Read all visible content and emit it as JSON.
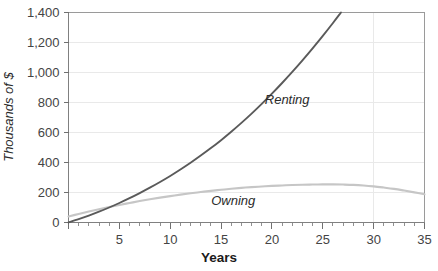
{
  "chart_data": {
    "type": "line",
    "title": "",
    "subtitle": "",
    "xlabel": "Years",
    "ylabel": "Thousands of $",
    "xlim": [
      0,
      35
    ],
    "ylim": [
      0,
      1400
    ],
    "grid": true,
    "legend_position": "inline-annotations",
    "x_ticks": [
      0,
      5,
      10,
      15,
      20,
      25,
      30,
      35
    ],
    "x_tick_labels": [
      "",
      "5",
      "10",
      "15",
      "20",
      "25",
      "30",
      "35"
    ],
    "x_minor_tick_step": 1,
    "y_ticks": [
      0,
      200,
      400,
      600,
      800,
      1000,
      1200,
      1400
    ],
    "y_tick_labels": [
      "0",
      "200",
      "400",
      "600",
      "800",
      "1,000",
      "1,200",
      "1,400"
    ],
    "x": [
      0,
      1,
      2,
      3,
      4,
      5,
      6,
      7,
      8,
      9,
      10,
      11,
      12,
      13,
      14,
      15,
      16,
      17,
      18,
      19,
      20,
      21,
      22,
      23,
      24,
      25,
      26,
      27,
      28,
      29,
      30,
      31,
      32,
      33,
      34,
      35
    ],
    "series": [
      {
        "name": "Renting",
        "color": "#5a5a5a",
        "label_x": 21.5,
        "label_y": 790,
        "values": [
          0,
          22,
          46,
          72,
          100,
          130,
          162,
          196,
          232,
          270,
          310,
          353,
          398,
          446,
          496,
          549,
          605,
          664,
          726,
          791,
          859,
          930,
          1004,
          1081,
          1161,
          1244,
          1330,
          1419,
          1511,
          1606,
          1704,
          1805,
          1909,
          2016,
          2126,
          2240
        ]
      },
      {
        "name": "Owning",
        "color": "#c6c6c6",
        "label_x": 16.2,
        "label_y": 120,
        "values": [
          40,
          57,
          73,
          88,
          103,
          117,
          130,
          143,
          155,
          166,
          176,
          186,
          195,
          203,
          211,
          218,
          225,
          231,
          236,
          240,
          244,
          247,
          250,
          252,
          253,
          254,
          254,
          253,
          251,
          247,
          241,
          233,
          224,
          213,
          201,
          188
        ]
      }
    ],
    "annotations": [
      {
        "text": "Renting",
        "x": 21.5,
        "y": 790
      },
      {
        "text": "Owning",
        "x": 16.2,
        "y": 120
      }
    ]
  }
}
